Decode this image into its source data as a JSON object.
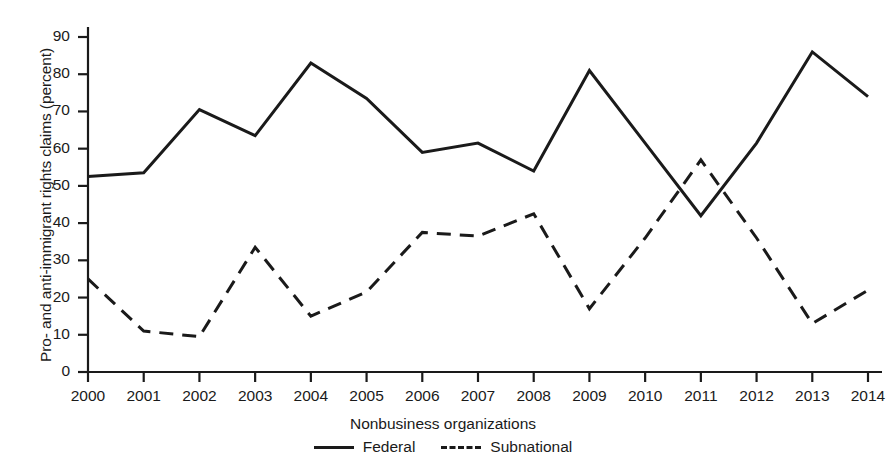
{
  "chart_data": {
    "type": "line",
    "title": "",
    "xlabel": "Nonbusiness organizations",
    "ylabel": "Pro- and anti-immigrant rights claims (percent)",
    "categories": [
      "2000",
      "2001",
      "2002",
      "2003",
      "2004",
      "2005",
      "2006",
      "2007",
      "2008",
      "2009",
      "2010",
      "2011",
      "2012",
      "2013",
      "2014"
    ],
    "x": [
      2000,
      2001,
      2002,
      2003,
      2004,
      2005,
      2006,
      2007,
      2008,
      2009,
      2010,
      2011,
      2012,
      2013,
      2014
    ],
    "xlim": [
      2000,
      2014
    ],
    "ylim": [
      0,
      90
    ],
    "yticks": [
      0,
      10,
      20,
      30,
      40,
      50,
      60,
      70,
      80,
      90
    ],
    "grid": false,
    "legend_position": "bottom-center",
    "series": [
      {
        "name": "Federal",
        "style": "solid",
        "color": "#1a1a1a",
        "values": [
          52.5,
          53.5,
          70.5,
          63.5,
          83.0,
          73.5,
          59.0,
          61.5,
          54.0,
          81.0,
          61.5,
          42.0,
          61.5,
          86.0,
          74.0
        ]
      },
      {
        "name": "Subnational",
        "style": "dashed",
        "color": "#1a1a1a",
        "values": [
          25.0,
          11.0,
          9.5,
          33.5,
          15.0,
          21.5,
          37.5,
          36.5,
          42.5,
          17.0,
          36.0,
          57.0,
          36.0,
          13.0,
          22.0
        ]
      }
    ]
  },
  "axis": {
    "ytick_labels": [
      "90",
      "80",
      "70",
      "60",
      "50",
      "40",
      "30",
      "20",
      "10",
      "0"
    ],
    "xtick_labels": [
      "2000",
      "2001",
      "2002",
      "2003",
      "2004",
      "2005",
      "2006",
      "2007",
      "2008",
      "2009",
      "2010",
      "2011",
      "2012",
      "2013",
      "2014"
    ]
  },
  "labels": {
    "ylabel": "Pro- and anti-immigrant rights claims (percent)",
    "xlabel": "Nonbusiness organizations"
  },
  "legend": {
    "items": [
      {
        "label": "Federal",
        "style": "solid"
      },
      {
        "label": "Subnational",
        "style": "dashed"
      }
    ]
  }
}
